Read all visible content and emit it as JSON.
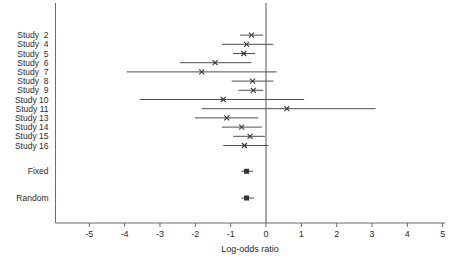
{
  "figure": {
    "background": "#ffffff",
    "text_color": "#2b2b2b",
    "line_color": "#4d4d4d",
    "axis_color": "#6b6b6b"
  },
  "chart_data": {
    "type": "scatter",
    "variant": "forest-plot",
    "title": "",
    "xlabel": "Log-odds ratio",
    "ylabel": "",
    "xlim": [
      -5.95,
      5.05
    ],
    "xticks": [
      -5,
      -4,
      -3,
      -2,
      -1,
      0,
      1,
      2,
      3,
      4,
      5
    ],
    "reference_line_x": 0,
    "grid": false,
    "legend": "none",
    "study_marker": "x-cross",
    "summary_marker": "filled-square",
    "studies": [
      {
        "label": "Study  2",
        "estimate": -0.41,
        "ci_lower": -0.73,
        "ci_upper": -0.08
      },
      {
        "label": "Study  4",
        "estimate": -0.55,
        "ci_lower": -1.25,
        "ci_upper": 0.21
      },
      {
        "label": "Study  5",
        "estimate": -0.63,
        "ci_lower": -0.93,
        "ci_upper": -0.31
      },
      {
        "label": "Study  6",
        "estimate": -1.44,
        "ci_lower": -2.43,
        "ci_upper": -0.41
      },
      {
        "label": "Study  7",
        "estimate": -1.82,
        "ci_lower": -3.94,
        "ci_upper": 0.3
      },
      {
        "label": "Study  8",
        "estimate": -0.38,
        "ci_lower": -0.97,
        "ci_upper": 0.21
      },
      {
        "label": "Study  9",
        "estimate": -0.36,
        "ci_lower": -0.78,
        "ci_upper": -0.08
      },
      {
        "label": "Study 10",
        "estimate": -1.21,
        "ci_lower": -3.57,
        "ci_upper": 1.08
      },
      {
        "label": "Study 11",
        "estimate": 0.59,
        "ci_lower": -1.82,
        "ci_upper": 3.1
      },
      {
        "label": "Study 13",
        "estimate": -1.11,
        "ci_lower": -2.01,
        "ci_upper": -0.22
      },
      {
        "label": "Study 14",
        "estimate": -0.69,
        "ci_lower": -1.25,
        "ci_upper": -0.12
      },
      {
        "label": "Study 15",
        "estimate": -0.45,
        "ci_lower": -0.93,
        "ci_upper": -0.03
      },
      {
        "label": "Study 16",
        "estimate": -0.61,
        "ci_lower": -1.21,
        "ci_upper": 0.07
      }
    ],
    "summaries": [
      {
        "label": "Fixed",
        "estimate": -0.55,
        "ci_lower": -0.69,
        "ci_upper": -0.36
      },
      {
        "label": "Random",
        "estimate": -0.55,
        "ci_lower": -0.7,
        "ci_upper": -0.34
      }
    ]
  }
}
